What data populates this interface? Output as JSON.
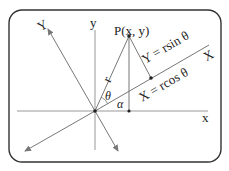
{
  "diagram": {
    "labels": {
      "point": "P(x, y)",
      "y_axis": "y",
      "x_axis": "x",
      "rotated_y_axis": "Y",
      "rotated_x_axis": "X",
      "radius": "r",
      "theta": "θ",
      "alpha": "α",
      "Y_formula": "Y = rsin θ",
      "X_formula": "X = rcos θ"
    },
    "colors": {
      "frame": "#333333",
      "axis": "#9a9a9a",
      "line": "#666666",
      "text": "#222222"
    }
  }
}
